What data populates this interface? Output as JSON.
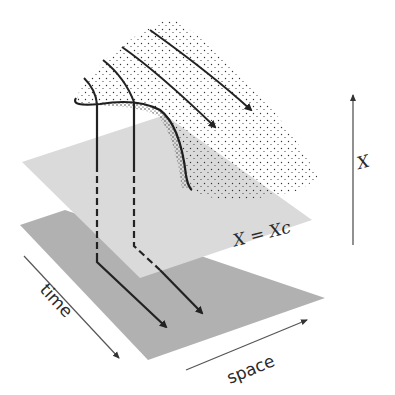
{
  "diagram": {
    "colors": {
      "background": "#ffffff",
      "upper_plane": "#d9d9d9",
      "lower_plane": "#a8a8a8",
      "ink": "#222222",
      "axis": "#555555"
    },
    "labels": {
      "vertical_axis": "X",
      "threshold_plane": "X = Xc",
      "time_axis": "time",
      "space_axis": "space"
    },
    "elements": {
      "surface": "stippled folded surface (fold edge at left)",
      "surface_arrows": 4,
      "projection_lines": 2,
      "planes": [
        "threshold plane X = Xc",
        "space-time base plane"
      ]
    }
  }
}
